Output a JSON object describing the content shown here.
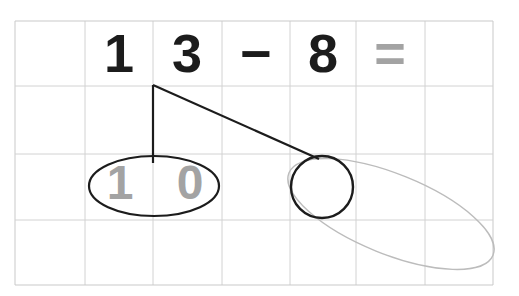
{
  "worksheet": {
    "title": "Subtraction with regrouping worksheet",
    "grid": {
      "columns": 7,
      "rows": 4,
      "line_color": "#cfcfcf",
      "border_color": "#bdbdbd",
      "background": "#ffffff",
      "left": 15,
      "top": 21,
      "right": 493,
      "bottom": 285,
      "vertical_lines": [
        15,
        85,
        153,
        222,
        290,
        356,
        425,
        493
      ],
      "horizontal_lines": [
        21,
        86,
        154,
        220,
        285
      ]
    },
    "equation": {
      "expression": "13 - 8 =",
      "cells": [
        {
          "name": "tens-digit",
          "text": "1",
          "color": "#1c1c1c",
          "x": 119,
          "y": 26
        },
        {
          "name": "ones-digit",
          "text": "3",
          "color": "#1c1c1c",
          "x": 187,
          "y": 26
        },
        {
          "name": "minus-sign",
          "text": "−",
          "color": "#1c1c1c",
          "x": 256,
          "y": 26
        },
        {
          "name": "subtrahend-digit",
          "text": "8",
          "color": "#1c1c1c",
          "x": 323,
          "y": 26
        },
        {
          "name": "equals-sign",
          "text": "=",
          "color": "#9c9c9c",
          "x": 390,
          "y": 26
        },
        {
          "name": "answer-blank",
          "text": "",
          "color": "#1c1c1c",
          "x": 459,
          "y": 26
        }
      ]
    },
    "decomposition": {
      "label": "13 split into 10 and 3",
      "branch_apex": {
        "x": 153,
        "y": 85
      },
      "left_branch_end": {
        "x": 153,
        "y": 162
      },
      "right_branch_end": {
        "x": 318,
        "y": 158
      },
      "stroke_color": "#1c1c1c",
      "ten_group": {
        "name": "ten-ellipse",
        "cx": 154,
        "cy": 186,
        "rx": 65,
        "ry": 30,
        "stroke_color": "#1c1c1c",
        "digits": [
          {
            "name": "ten-tens-digit",
            "text": "1",
            "color": "#a3a3a3",
            "x": 120,
            "y": 159
          },
          {
            "name": "ten-ones-digit",
            "text": "0",
            "color": "#a3a3a3",
            "x": 190,
            "y": 159
          }
        ]
      },
      "unit_group": {
        "name": "unit-circle",
        "cx": 322,
        "cy": 187,
        "r": 31,
        "stroke_color": "#1c1c1c"
      },
      "sweep_group": {
        "name": "sweep-ellipse",
        "cx": 391,
        "cy": 214,
        "rx": 110,
        "ry": 40,
        "rotation_degrees": 22,
        "stroke_color": "#bcbcbc"
      }
    }
  }
}
